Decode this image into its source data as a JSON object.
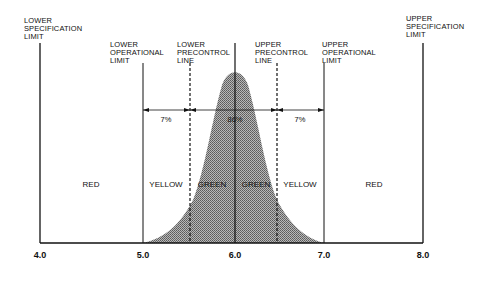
{
  "limits": {
    "lower_spec": [
      "LOWER",
      "SPECIFICATION",
      "LIMIT"
    ],
    "lower_operational": [
      "LOWER",
      "OPERATIONAL",
      "LIMIT"
    ],
    "lower_precontrol": [
      "LOWER",
      "PRECONTROL",
      "LINE"
    ],
    "upper_precontrol": [
      "UPPER",
      "PRECONTROL",
      "LINE"
    ],
    "upper_operational": [
      "UPPER",
      "OPERATIONAL",
      "LIMIT"
    ],
    "upper_spec": [
      "UPPER",
      "SPECIFICATION",
      "LIMIT"
    ]
  },
  "percentages": {
    "left": "7%",
    "middle": "86%",
    "right": "7%"
  },
  "regions": {
    "far_left": "RED",
    "left_yellow": "YELLOW",
    "left_green": "GREEN",
    "right_green": "GREEN",
    "right_yellow": "YELLOW",
    "far_right": "RED"
  },
  "axis": {
    "ticks": [
      "4.0",
      "5.0",
      "6.0",
      "7.0",
      "8.0"
    ]
  },
  "colors": {
    "curve_fill": "#9a9a9a",
    "line": "#111111",
    "background": "#ffffff"
  }
}
